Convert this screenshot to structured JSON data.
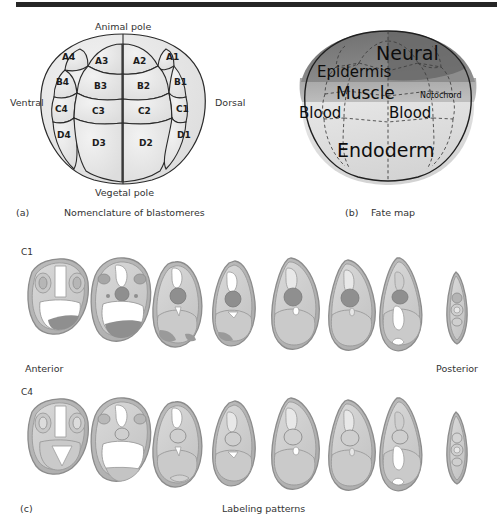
{
  "figure": {
    "background_color": "#ffffff",
    "rule_color": "#262626"
  },
  "panel_a": {
    "panel_letter": "(a)",
    "caption": "Nomenclature of blastomeres",
    "axis_labels": {
      "top": "Animal pole",
      "bottom": "Vegetal pole",
      "left": "Ventral",
      "right": "Dorsal"
    },
    "blastomeres": [
      {
        "label": "A4",
        "x": 70,
        "y": 58
      },
      {
        "label": "A3",
        "x": 102,
        "y": 62
      },
      {
        "label": "A2",
        "x": 138,
        "y": 62
      },
      {
        "label": "A1",
        "x": 172,
        "y": 58
      },
      {
        "label": "B4",
        "x": 64,
        "y": 82
      },
      {
        "label": "B3",
        "x": 101,
        "y": 86
      },
      {
        "label": "B2",
        "x": 143,
        "y": 86
      },
      {
        "label": "B1",
        "x": 180,
        "y": 82
      },
      {
        "label": "C4",
        "x": 62,
        "y": 110
      },
      {
        "label": "C3",
        "x": 99,
        "y": 112
      },
      {
        "label": "C2",
        "x": 144,
        "y": 112
      },
      {
        "label": "C1",
        "x": 182,
        "y": 110
      },
      {
        "label": "D4",
        "x": 63,
        "y": 135
      },
      {
        "label": "D3",
        "x": 99,
        "y": 143
      },
      {
        "label": "D2",
        "x": 145,
        "y": 143
      },
      {
        "label": "D1",
        "x": 183,
        "y": 135
      }
    ],
    "cell_fill": "#e4e4e4",
    "cell_stroke": "#2a2a2a"
  },
  "panel_b": {
    "panel_letter": "(b)",
    "caption": "Fate map",
    "regions": [
      {
        "label": "Neural",
        "size": "xl",
        "x": 411,
        "y": 55,
        "tint": "#7d7d7d"
      },
      {
        "label": "Epidermis",
        "size": "md",
        "x": 374,
        "y": 73,
        "tint": "#959595"
      },
      {
        "label": "Muscle",
        "size": "lg",
        "x": 389,
        "y": 94,
        "tint": "#9e9e9e"
      },
      {
        "label": "Notochord",
        "size": "xs",
        "x": 447,
        "y": 95,
        "tint": "#a8a8a8"
      },
      {
        "label": "Blood",
        "size": "md",
        "x": 336,
        "y": 113,
        "tint": "#a0a0a0"
      },
      {
        "label": "Blood",
        "size": "md",
        "x": 417,
        "y": 113,
        "tint": "#a0a0a0"
      },
      {
        "label": "Endoderm",
        "size": "xl",
        "x": 394,
        "y": 152,
        "tint": "#dcdcdc"
      }
    ],
    "shade_dark": "#767676",
    "shade_mid": "#a4a4a4",
    "shade_light": "#d8d8d8",
    "dashed_stroke": "#4a4a4a",
    "outline_stroke": "#1f1f1f"
  },
  "panel_c": {
    "panel_letter": "(c)",
    "caption": "Labeling patterns",
    "rows": [
      {
        "label": "C1",
        "y_label": 252
      },
      {
        "label": "C4",
        "y_label": 392
      }
    ],
    "orientation_labels": {
      "left": "Anterior",
      "right": "Posterior"
    },
    "section_count": 8,
    "embryo_fill": "#cfcfcf",
    "embryo_membrane": "#b3b3b3",
    "embryo_stroke": "#8c8c8c",
    "marker_dark": "#8f8f8f",
    "marker_light": "#ffffff"
  }
}
